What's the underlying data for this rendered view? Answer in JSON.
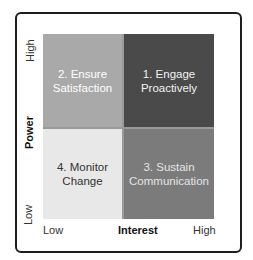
{
  "matrix": {
    "title": "Power / Interest Grid",
    "y_axis": {
      "label": "Power",
      "high": "High",
      "low": "Low"
    },
    "x_axis": {
      "label": "Interest",
      "low": "Low",
      "high": "High"
    },
    "quadrants": {
      "top_left": {
        "label": "2. Ensure\nSatisfaction",
        "color": "#a9a9a9",
        "text_color": "#ffffff"
      },
      "top_right": {
        "label": "1. Engage\nProactively",
        "color": "#4a4a4a",
        "text_color": "#f2f2f2"
      },
      "bottom_left": {
        "label": "4. Monitor\nChange",
        "color": "#e8e8e8",
        "text_color": "#333333"
      },
      "bottom_right": {
        "label": "3. Sustain\nCommunication",
        "color": "#7b7b7b",
        "text_color": "#e4e4e4"
      }
    }
  }
}
